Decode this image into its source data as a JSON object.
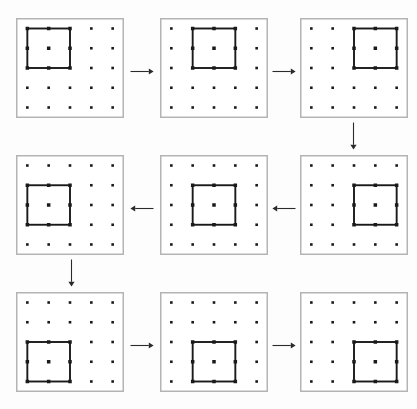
{
  "figure": {
    "type": "diagram",
    "kind": "sliding-window-sequence",
    "background_color": "#fdfdfd",
    "panel_border_color": "#b4b4b4",
    "dot_color": "#1a1a1a",
    "window_stroke_color": "#1a1a1a",
    "arrow_color": "#2a2a2a"
  },
  "lattice": {
    "rows": 5,
    "cols": 5,
    "dot_count": 25,
    "dot_size_px": 2.6,
    "window_span_dots": 3
  },
  "panels": [
    {
      "id": "panel-1",
      "index": 1,
      "grid_row": 1,
      "grid_col": 1,
      "window_row": 0,
      "window_col": 0,
      "window_position": "top-left",
      "x": 16,
      "y": 18,
      "w": 108,
      "h": 100
    },
    {
      "id": "panel-2",
      "index": 2,
      "grid_row": 1,
      "grid_col": 2,
      "window_row": 0,
      "window_col": 1,
      "window_position": "top-center",
      "x": 160,
      "y": 18,
      "w": 108,
      "h": 100
    },
    {
      "id": "panel-3",
      "index": 3,
      "grid_row": 1,
      "grid_col": 3,
      "window_row": 0,
      "window_col": 2,
      "window_position": "top-right",
      "x": 300,
      "y": 18,
      "w": 108,
      "h": 100
    },
    {
      "id": "panel-4",
      "index": 4,
      "grid_row": 2,
      "grid_col": 3,
      "window_row": 1,
      "window_col": 2,
      "window_position": "middle-right",
      "x": 300,
      "y": 155,
      "w": 108,
      "h": 100
    },
    {
      "id": "panel-5",
      "index": 5,
      "grid_row": 2,
      "grid_col": 2,
      "window_row": 1,
      "window_col": 1,
      "window_position": "middle-center",
      "x": 160,
      "y": 155,
      "w": 108,
      "h": 100
    },
    {
      "id": "panel-6",
      "index": 6,
      "grid_row": 2,
      "grid_col": 1,
      "window_row": 1,
      "window_col": 0,
      "window_position": "middle-left",
      "x": 16,
      "y": 155,
      "w": 108,
      "h": 100
    },
    {
      "id": "panel-7",
      "index": 7,
      "grid_row": 3,
      "grid_col": 1,
      "window_row": 2,
      "window_col": 0,
      "window_position": "bottom-left",
      "x": 16,
      "y": 292,
      "w": 108,
      "h": 100
    },
    {
      "id": "panel-8",
      "index": 8,
      "grid_row": 3,
      "grid_col": 2,
      "window_row": 2,
      "window_col": 1,
      "window_position": "bottom-center",
      "x": 160,
      "y": 292,
      "w": 108,
      "h": 100
    },
    {
      "id": "panel-9",
      "index": 9,
      "grid_row": 3,
      "grid_col": 3,
      "window_row": 2,
      "window_col": 2,
      "window_position": "bottom-right",
      "x": 300,
      "y": 292,
      "w": 108,
      "h": 100
    }
  ],
  "arrows": [
    {
      "id": "arrow-1",
      "from": "panel-1",
      "to": "panel-2",
      "direction": "right",
      "x": 130,
      "y": 66,
      "length": 24
    },
    {
      "id": "arrow-2",
      "from": "panel-2",
      "to": "panel-3",
      "direction": "right",
      "x": 272,
      "y": 66,
      "length": 24
    },
    {
      "id": "arrow-3",
      "from": "panel-3",
      "to": "panel-4",
      "direction": "down",
      "x": 348,
      "y": 122,
      "length": 28
    },
    {
      "id": "arrow-4",
      "from": "panel-4",
      "to": "panel-5",
      "direction": "left",
      "x": 272,
      "y": 203,
      "length": 24
    },
    {
      "id": "arrow-5",
      "from": "panel-5",
      "to": "panel-6",
      "direction": "left",
      "x": 130,
      "y": 203,
      "length": 24
    },
    {
      "id": "arrow-6",
      "from": "panel-6",
      "to": "panel-7",
      "direction": "down",
      "x": 66,
      "y": 259,
      "length": 28
    },
    {
      "id": "arrow-7",
      "from": "panel-7",
      "to": "panel-8",
      "direction": "right",
      "x": 130,
      "y": 340,
      "length": 24
    },
    {
      "id": "arrow-8",
      "from": "panel-8",
      "to": "panel-9",
      "direction": "right",
      "x": 272,
      "y": 340,
      "length": 24
    }
  ]
}
